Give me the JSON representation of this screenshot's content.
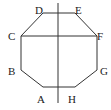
{
  "diagram": {
    "title": "",
    "shape": "octagon",
    "stroke_color": "#333333",
    "vertices": [
      {
        "name": "A",
        "x": 43,
        "y": 87,
        "label_x": 37,
        "label_y": 103
      },
      {
        "name": "B",
        "x": 21,
        "y": 70,
        "label_x": 8,
        "label_y": 75
      },
      {
        "name": "C",
        "x": 21,
        "y": 36,
        "label_x": 8,
        "label_y": 40
      },
      {
        "name": "D",
        "x": 43,
        "y": 13,
        "label_x": 35,
        "label_y": 14
      },
      {
        "name": "E",
        "x": 75,
        "y": 13,
        "label_x": 75,
        "label_y": 14
      },
      {
        "name": "F",
        "x": 97,
        "y": 36,
        "label_x": 97,
        "label_y": 40
      },
      {
        "name": "G",
        "x": 97,
        "y": 70,
        "label_x": 100,
        "label_y": 75
      },
      {
        "name": "H",
        "x": 75,
        "y": 87,
        "label_x": 68,
        "label_y": 103
      }
    ],
    "segments": [
      {
        "name": "CF",
        "from": "C",
        "to": "F"
      },
      {
        "name": "vertical-axis",
        "x": 58,
        "y1": 3,
        "y2": 103
      }
    ]
  }
}
